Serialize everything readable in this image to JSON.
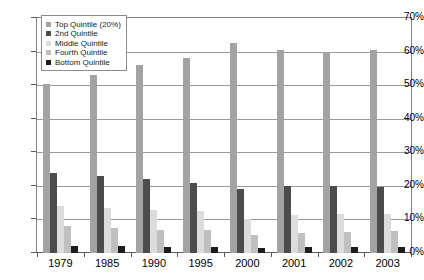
{
  "chart_data": {
    "type": "bar",
    "title": "",
    "xlabel": "",
    "ylabel": "",
    "ylim": [
      0,
      70
    ],
    "y_tick_labels": [
      "0%",
      "10%",
      "20%",
      "30%",
      "40%",
      "50%",
      "60%",
      "70%"
    ],
    "y_tick_values": [
      0,
      10,
      20,
      30,
      40,
      50,
      60,
      70
    ],
    "grid": true,
    "legend_position": "upper-left-inside",
    "categories": [
      "1979",
      "1985",
      "1990",
      "1995",
      "2000",
      "2001",
      "2002",
      "2003"
    ],
    "series": [
      {
        "name": "Top Quintile (20%)",
        "color": "#a3a3a3",
        "values": [
          50.3,
          53.0,
          56.0,
          58.0,
          62.5,
          60.5,
          60.0,
          60.5
        ]
      },
      {
        "name": "2nd Quintile",
        "color": "#4c4c4c",
        "values": [
          23.8,
          22.8,
          22.0,
          21.0,
          19.0,
          20.0,
          20.0,
          19.8
        ]
      },
      {
        "name": "Middle Quintile",
        "color": "#dcdcdc",
        "values": [
          14.0,
          13.5,
          12.8,
          12.5,
          10.0,
          11.2,
          11.5,
          11.5
        ]
      },
      {
        "name": "Fourth Quintile",
        "color": "#bfbfbf",
        "values": [
          8.0,
          7.5,
          7.0,
          6.8,
          5.5,
          6.0,
          6.2,
          6.5
        ]
      },
      {
        "name": "Bottom Quintile",
        "color": "#1c1c1c",
        "values": [
          2.2,
          2.0,
          1.8,
          1.8,
          1.5,
          1.8,
          1.8,
          1.8
        ]
      }
    ]
  },
  "legend": {
    "items": [
      {
        "label": "Top Quintile (20%)"
      },
      {
        "label": "2nd Quintile"
      },
      {
        "label": "Middle Quintile"
      },
      {
        "label": "Fourth Quintile"
      },
      {
        "label": "Bottom Quintile"
      }
    ]
  }
}
